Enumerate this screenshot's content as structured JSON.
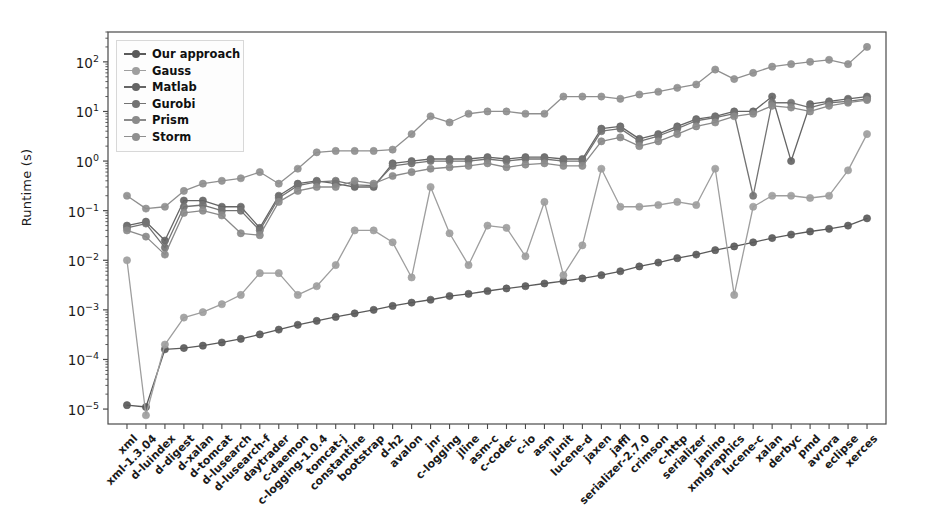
{
  "chart_data": {
    "type": "line",
    "title": "",
    "xlabel": "",
    "ylabel": "Runtime (s)",
    "yscale": "log",
    "ylim": [
      5e-06,
      400
    ],
    "grid": false,
    "legend_position": "upper left",
    "ytick_labels": [
      "10^2",
      "10^1",
      "10^0",
      "10^-1",
      "10^-2",
      "10^-3",
      "10^-4",
      "10^-5"
    ],
    "ytick_values": [
      100,
      10,
      1,
      0.1,
      0.01,
      0.001,
      0.0001,
      1e-05
    ],
    "categories": [
      "xml",
      "xml-1.3.04",
      "d-luindex",
      "d-digest",
      "d-xalan",
      "d-tomcat",
      "d-lusearch",
      "d-lusearch-f",
      "daytrader",
      "c-daemon",
      "c-logging-1.0.4",
      "tomcat-j",
      "constantine",
      "bootstrap",
      "d-h2",
      "avalon",
      "jnr",
      "c-logging",
      "jline",
      "asm-c",
      "c-codec",
      "c-io",
      "asm",
      "junit",
      "lucene-d",
      "jaxen",
      "jaffl",
      "serializer-2.7.0",
      "crimson",
      "c-http",
      "serializer",
      "janino",
      "xmlgraphics",
      "lucene-c",
      "xalan",
      "derbyc",
      "pmd",
      "avrora",
      "eclipse",
      "xerces"
    ],
    "series": [
      {
        "name": "Our approach",
        "color": "#5a5a5a",
        "values": [
          1.2e-05,
          1.1e-05,
          0.00016,
          0.00017,
          0.00019,
          0.00022,
          0.00026,
          0.00032,
          0.0004,
          0.0005,
          0.0006,
          0.00072,
          0.00085,
          0.001,
          0.0012,
          0.0014,
          0.0016,
          0.0019,
          0.0021,
          0.0024,
          0.0027,
          0.003,
          0.0034,
          0.0038,
          0.0043,
          0.005,
          0.006,
          0.0075,
          0.009,
          0.011,
          0.013,
          0.016,
          0.019,
          0.023,
          0.028,
          0.033,
          0.038,
          0.043,
          0.05,
          0.07
        ]
      },
      {
        "name": "Gauss",
        "color": "#9e9e9e",
        "values": [
          0.01,
          7.5e-06,
          0.0002,
          0.0007,
          0.0009,
          0.0013,
          0.002,
          0.0055,
          0.0055,
          0.002,
          0.003,
          0.008,
          0.04,
          0.04,
          0.023,
          0.0045,
          0.3,
          0.035,
          0.008,
          0.05,
          0.045,
          0.012,
          0.15,
          0.005,
          0.02,
          0.7,
          0.12,
          0.12,
          0.13,
          0.15,
          0.13,
          0.7,
          0.002,
          0.12,
          0.2,
          0.2,
          0.18,
          0.2,
          0.65,
          3.5
        ]
      },
      {
        "name": "Matlab",
        "color": "#656565",
        "values": [
          0.05,
          0.06,
          0.025,
          0.16,
          0.16,
          0.12,
          0.12,
          0.045,
          0.2,
          0.35,
          0.4,
          0.35,
          0.3,
          0.3,
          0.9,
          1.0,
          1.1,
          1.1,
          1.1,
          1.2,
          1.1,
          1.2,
          1.2,
          1.1,
          1.1,
          4.5,
          5.0,
          2.8,
          3.5,
          5.0,
          7.0,
          8.0,
          10.0,
          10.0,
          20.0,
          1.0,
          14.0,
          16.0,
          18.0,
          20.0
        ]
      },
      {
        "name": "Gurobi",
        "color": "#737373",
        "values": [
          0.045,
          0.055,
          0.018,
          0.12,
          0.13,
          0.1,
          0.1,
          0.04,
          0.18,
          0.32,
          0.38,
          0.4,
          0.33,
          0.32,
          0.8,
          0.9,
          1.0,
          1.0,
          1.0,
          1.1,
          1.0,
          1.1,
          1.1,
          1.0,
          1.0,
          4.0,
          4.5,
          2.5,
          3.2,
          4.5,
          6.5,
          7.5,
          9.0,
          0.2,
          15.0,
          15.0,
          12.0,
          15.0,
          16.0,
          18.0
        ]
      },
      {
        "name": "Prism",
        "color": "#8a8a8a",
        "values": [
          0.04,
          0.03,
          0.013,
          0.09,
          0.1,
          0.08,
          0.035,
          0.032,
          0.15,
          0.25,
          0.3,
          0.3,
          0.4,
          0.35,
          0.5,
          0.6,
          0.7,
          0.75,
          0.8,
          0.9,
          0.75,
          0.85,
          0.9,
          0.8,
          0.8,
          2.5,
          3.0,
          2.0,
          2.5,
          3.5,
          5.0,
          6.0,
          8.0,
          9.0,
          13.0,
          12.0,
          10.0,
          13.0,
          15.0,
          17.0
        ]
      },
      {
        "name": "Storm",
        "color": "#8f8f8f",
        "values": [
          0.2,
          0.11,
          0.12,
          0.25,
          0.35,
          0.4,
          0.45,
          0.6,
          0.35,
          0.7,
          1.5,
          1.6,
          1.6,
          1.6,
          1.7,
          3.5,
          8.0,
          6.0,
          9.0,
          10.0,
          10.0,
          9.0,
          9.0,
          20.0,
          20.0,
          20.0,
          18.0,
          22.0,
          25.0,
          30.0,
          35.0,
          70.0,
          45.0,
          60.0,
          80.0,
          90.0,
          100.0,
          110.0,
          90.0,
          200.0
        ]
      }
    ]
  },
  "legend": {
    "items": [
      {
        "label": "Our approach"
      },
      {
        "label": "Gauss"
      },
      {
        "label": "Matlab"
      },
      {
        "label": "Gurobi"
      },
      {
        "label": "Prism"
      },
      {
        "label": "Storm"
      }
    ]
  }
}
